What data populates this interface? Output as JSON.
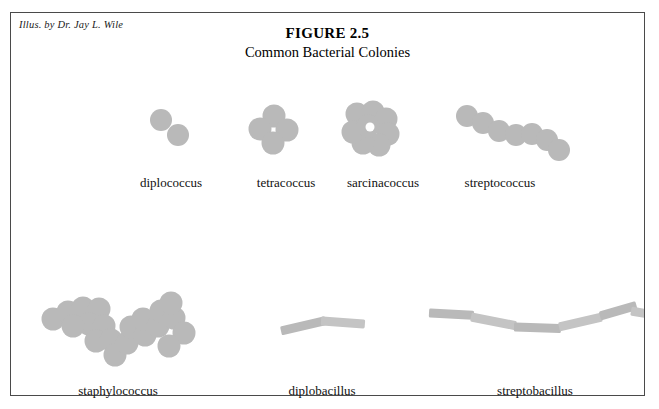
{
  "credit": "Illus. by Dr. Jay L. Wile",
  "title": {
    "number": "FIGURE 2.5",
    "subtitle": "Common Bacterial Colonies"
  },
  "colors": {
    "cell_fill": "#b9b9b9",
    "cell_fill_light": "#c4c4c4",
    "border": "#4a4a4a",
    "text": "#111111",
    "background": "#ffffff"
  },
  "colonies": [
    {
      "id": "diplococcus",
      "label": "diplococcus",
      "type": "cocci",
      "label_x": 160,
      "label_y": 162,
      "radius": 11,
      "cells": [
        {
          "cx": 150,
          "cy": 107
        },
        {
          "cx": 167,
          "cy": 122
        }
      ]
    },
    {
      "id": "tetracoccus",
      "label": "tetracoccus",
      "type": "cocci",
      "label_x": 275,
      "label_y": 162,
      "radius": 11.5,
      "cells": [
        {
          "cx": 263,
          "cy": 103
        },
        {
          "cx": 249,
          "cy": 116
        },
        {
          "cx": 276,
          "cy": 117
        },
        {
          "cx": 262,
          "cy": 130
        }
      ]
    },
    {
      "id": "sarcinacoccus",
      "label": "sarcinacoccus",
      "type": "cocci",
      "label_x": 372,
      "label_y": 162,
      "radius": 11.5,
      "hole": {
        "cx": 359,
        "cy": 114,
        "r": 4.5
      },
      "cells": [
        {
          "cx": 346,
          "cy": 101
        },
        {
          "cx": 362,
          "cy": 99
        },
        {
          "cx": 375,
          "cy": 106
        },
        {
          "cx": 377,
          "cy": 121
        },
        {
          "cx": 368,
          "cy": 132
        },
        {
          "cx": 352,
          "cy": 130
        },
        {
          "cx": 342,
          "cy": 119
        },
        {
          "cx": 357,
          "cy": 113
        }
      ]
    },
    {
      "id": "streptococcus",
      "label": "streptococcus",
      "type": "cocci",
      "label_x": 489,
      "label_y": 162,
      "radius": 11,
      "cells": [
        {
          "cx": 456,
          "cy": 103
        },
        {
          "cx": 472,
          "cy": 110
        },
        {
          "cx": 488,
          "cy": 118
        },
        {
          "cx": 505,
          "cy": 122
        },
        {
          "cx": 521,
          "cy": 121
        },
        {
          "cx": 536,
          "cy": 127
        },
        {
          "cx": 548,
          "cy": 137
        }
      ]
    },
    {
      "id": "staphylococcus",
      "label": "staphylococcus",
      "type": "cocci",
      "label_x": 107,
      "label_y": 370,
      "radius": 11.5,
      "cells": [
        {
          "cx": 42,
          "cy": 306
        },
        {
          "cx": 57,
          "cy": 299
        },
        {
          "cx": 72,
          "cy": 295
        },
        {
          "cx": 88,
          "cy": 296
        },
        {
          "cx": 78,
          "cy": 311
        },
        {
          "cx": 62,
          "cy": 313
        },
        {
          "cx": 93,
          "cy": 313
        },
        {
          "cx": 85,
          "cy": 328
        },
        {
          "cx": 100,
          "cy": 327
        },
        {
          "cx": 104,
          "cy": 342
        },
        {
          "cx": 116,
          "cy": 330
        },
        {
          "cx": 120,
          "cy": 314
        },
        {
          "cx": 134,
          "cy": 322
        },
        {
          "cx": 132,
          "cy": 306
        },
        {
          "cx": 147,
          "cy": 313
        },
        {
          "cx": 150,
          "cy": 298
        },
        {
          "cx": 163,
          "cy": 305
        },
        {
          "cx": 160,
          "cy": 290
        },
        {
          "cx": 173,
          "cy": 320
        },
        {
          "cx": 158,
          "cy": 333
        }
      ]
    },
    {
      "id": "diplobacillus",
      "label": "diplobacillus",
      "type": "bacilli",
      "label_x": 311,
      "label_y": 370,
      "rod_height": 9,
      "rods": [
        {
          "x": 270,
          "y": 318,
          "w": 46,
          "angle": -13
        },
        {
          "x": 310,
          "y": 308,
          "w": 44,
          "angle": 4
        }
      ]
    },
    {
      "id": "streptobacillus",
      "label": "streptobacillus",
      "type": "bacilli",
      "label_x": 524,
      "label_y": 370,
      "rod_height": 9,
      "rods": [
        {
          "x": 418,
          "y": 300,
          "w": 45,
          "angle": 3
        },
        {
          "x": 460,
          "y": 304,
          "w": 46,
          "angle": 11
        },
        {
          "x": 503,
          "y": 314,
          "w": 47,
          "angle": 2
        },
        {
          "x": 548,
          "y": 314,
          "w": 44,
          "angle": -13
        },
        {
          "x": 589,
          "y": 303,
          "w": 38,
          "angle": -16
        },
        {
          "x": 620,
          "y": 298,
          "w": 33,
          "angle": 10
        }
      ]
    }
  ]
}
